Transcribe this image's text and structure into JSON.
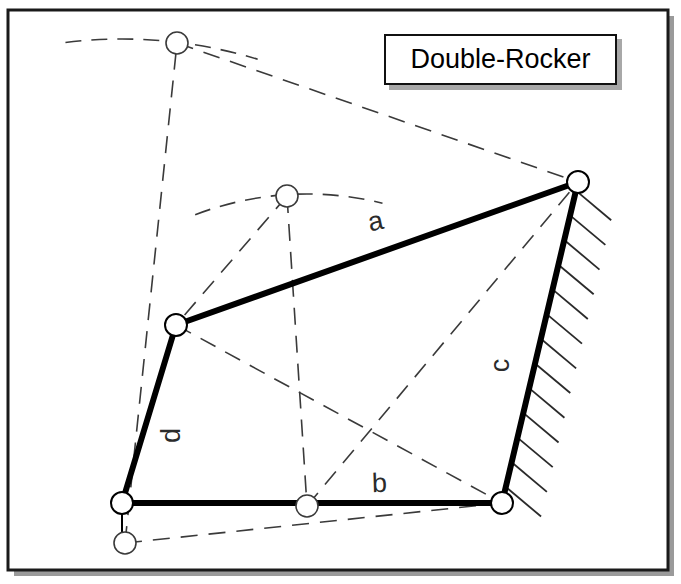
{
  "figure": {
    "title": "Double-Rocker",
    "kind": "four-bar-linkage-diagram",
    "frame": {
      "border_color": "#1a1a1a",
      "shadow_color": "#9a9a9a",
      "x": 8,
      "y": 10,
      "w": 660,
      "h": 560
    },
    "title_box": {
      "label": "Double-Rocker",
      "x": 384,
      "y": 34,
      "w": 233,
      "h": 51,
      "border_color": "#111111",
      "shadow_color": "#a8a8a8",
      "fill": "#ffffff"
    },
    "link_labels": [
      {
        "name": "a",
        "text": "a",
        "x": 378,
        "y": 222,
        "rotation": -12
      },
      {
        "name": "b",
        "text": "b",
        "x": 382,
        "y": 484,
        "rotation": -2
      },
      {
        "name": "c",
        "text": "c",
        "x": 505,
        "y": 365,
        "rotation": -90
      },
      {
        "name": "d",
        "text": "d",
        "x": 176,
        "y": 436,
        "rotation": -90
      }
    ],
    "joints": [
      {
        "name": "ground-pivot-left",
        "x": 122,
        "y": 503,
        "r": 11,
        "style": "solid"
      },
      {
        "name": "ground-pivot-right",
        "x": 502,
        "y": 503,
        "r": 11,
        "style": "solid"
      },
      {
        "name": "coupler-joint-right",
        "x": 578,
        "y": 182,
        "r": 11,
        "style": "solid"
      },
      {
        "name": "coupler-joint-left",
        "x": 176,
        "y": 325,
        "r": 11,
        "style": "solid"
      },
      {
        "name": "ghost-joint-top",
        "x": 177,
        "y": 43,
        "r": 11,
        "style": "ghost"
      },
      {
        "name": "ghost-joint-mid",
        "x": 287,
        "y": 196,
        "r": 11,
        "style": "ghost"
      },
      {
        "name": "ghost-joint-bottom-center",
        "x": 307,
        "y": 506,
        "r": 11,
        "style": "ghost"
      },
      {
        "name": "ghost-joint-bottom-left",
        "x": 125,
        "y": 543,
        "r": 11,
        "style": "ghost"
      }
    ],
    "solid_links": [
      {
        "name": "link-a-coupler",
        "x1": 176,
        "y1": 325,
        "x2": 578,
        "y2": 182,
        "width": 6
      },
      {
        "name": "link-b-ground",
        "x1": 122,
        "y1": 503,
        "x2": 502,
        "y2": 503,
        "width": 6
      },
      {
        "name": "link-c-rocker",
        "x1": 578,
        "y1": 182,
        "x2": 502,
        "y2": 503,
        "width": 6
      },
      {
        "name": "link-d-rocker",
        "x1": 122,
        "y1": 503,
        "x2": 176,
        "y2": 325,
        "width": 6
      }
    ],
    "ghost_links": [
      {
        "name": "ghost-link-a",
        "x1": 177,
        "y1": 43,
        "x2": 578,
        "y2": 182
      },
      {
        "name": "ghost-link-d",
        "x1": 125,
        "y1": 543,
        "x2": 177,
        "y2": 43
      },
      {
        "name": "ghost-link-b",
        "x1": 125,
        "y1": 543,
        "x2": 502,
        "y2": 503
      },
      {
        "name": "ghost-cross-1",
        "x1": 176,
        "y1": 325,
        "x2": 502,
        "y2": 503
      },
      {
        "name": "ghost-cross-2",
        "x1": 307,
        "y1": 506,
        "x2": 578,
        "y2": 182
      },
      {
        "name": "ghost-coupler-mid-left",
        "x1": 287,
        "y1": 196,
        "x2": 176,
        "y2": 325
      },
      {
        "name": "ghost-coupler-mid-down",
        "x1": 287,
        "y1": 196,
        "x2": 307,
        "y2": 506
      }
    ],
    "arcs": [
      {
        "name": "arc-left-rocker-d",
        "cx": 122,
        "cy": 503,
        "r": 464,
        "start_deg": 263,
        "end_deg": 287
      },
      {
        "name": "arc-coupler-sweep",
        "cx": 307,
        "cy": 506,
        "r": 312,
        "start_deg": 249,
        "end_deg": 284
      }
    ],
    "hatching": {
      "name": "ground-hatching-right",
      "count": 13,
      "along": {
        "x1": 578,
        "y1": 182,
        "x2": 502,
        "y2": 503
      },
      "length": 46,
      "angle_deg": 40,
      "color": "#2a2a2a"
    },
    "ground_tick": {
      "name": "ground-tick-left",
      "x1": 122,
      "y1": 503,
      "x2": 122,
      "y2": 545
    },
    "colors": {
      "ink": "#000000",
      "ghost": "#3a3a3a",
      "shadow": "#9a9a9a",
      "paper": "#ffffff"
    }
  }
}
